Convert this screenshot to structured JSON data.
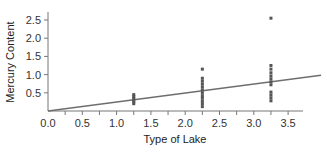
{
  "chart_data": {
    "type": "scatter",
    "title": "",
    "xlabel": "Type of Lake",
    "ylabel": "Mercury Content",
    "xlim": [
      0,
      3.8
    ],
    "ylim": [
      0,
      2.6
    ],
    "x_ticks": [
      0.0,
      0.5,
      1.0,
      1.5,
      2.0,
      2.5,
      3.0,
      3.5
    ],
    "x_tick_labels": [
      "0.0",
      "0.5",
      "1.0",
      "1.5",
      "2.0",
      "2.5",
      "3.0",
      "3.5"
    ],
    "y_ticks": [
      0.5,
      1.0,
      1.5,
      2.0,
      2.5
    ],
    "y_tick_labels": [
      "0.5",
      "1.0",
      "1.5",
      "2.0",
      "2.5"
    ],
    "grid": false,
    "legend": null,
    "series": [
      {
        "name": "Lake type 1",
        "x": 1.25,
        "values": [
          0.2,
          0.25,
          0.3,
          0.35,
          0.4,
          0.45
        ]
      },
      {
        "name": "Lake type 2",
        "x": 2.25,
        "values": [
          1.15,
          0.9,
          0.82,
          0.74,
          0.66,
          0.58,
          0.5,
          0.42,
          0.35,
          0.27,
          0.2,
          0.12
        ]
      },
      {
        "name": "Lake type 3",
        "x": 3.25,
        "values": [
          2.55,
          1.25,
          1.15,
          1.05,
          0.96,
          0.88,
          0.8,
          0.72,
          0.52,
          0.44,
          0.36,
          0.28
        ]
      }
    ],
    "regression_line": {
      "x0": 0.0,
      "y0": 0.0,
      "x1": 3.98,
      "y1": 0.98,
      "slope": 0.245,
      "intercept": 0.0
    }
  },
  "colors": {
    "points": "#555555",
    "line": "#6e6e6e",
    "axis": "#777777",
    "text": "#333333"
  }
}
